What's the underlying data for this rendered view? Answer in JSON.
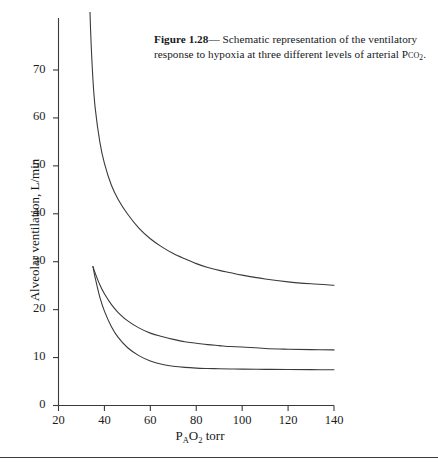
{
  "caption": {
    "figure_label": "Figure 1.28",
    "dash": "— ",
    "text_line1": "Schematic representation of the ventilatory",
    "text_line2": "response to hypoxia at three different levels of arterial",
    "gas_prefix": "P",
    "gas_smallcaps": "co",
    "gas_subscript": "2",
    "gas_period": ".",
    "full_text": "Figure 1.28— Schematic representation of the ventilatory response to hypoxia at three different levels of arterial Pco2."
  },
  "chart_data": {
    "type": "line",
    "title": "",
    "xlabel": "PAO2 torr",
    "ylabel": "Alveolar ventilation, L/min",
    "xlim": [
      20,
      140
    ],
    "ylim": [
      0,
      75
    ],
    "xticks": [
      20,
      40,
      60,
      80,
      100,
      120,
      140
    ],
    "yticks": [
      0,
      10,
      20,
      30,
      40,
      50,
      60,
      70
    ],
    "grid": false,
    "legend": "none",
    "line_color": "#3a3a3a",
    "line_width": 1.1,
    "series": [
      {
        "name": "high PCO2",
        "x": [
          33.5,
          34,
          35,
          36,
          38,
          40,
          43,
          46,
          50,
          55,
          60,
          65,
          70,
          75,
          80,
          85,
          90,
          95,
          100,
          110,
          120,
          130,
          140
        ],
        "y": [
          86,
          78,
          68,
          62,
          55,
          50.5,
          46,
          43,
          40,
          37,
          34.8,
          33.1,
          31.7,
          30.6,
          29.6,
          28.8,
          28.2,
          27.7,
          27.2,
          26.4,
          25.8,
          25.4,
          25.1
        ]
      },
      {
        "name": "normal PCO2",
        "x": [
          35,
          36,
          38,
          40,
          43,
          46,
          50,
          55,
          60,
          65,
          70,
          75,
          80,
          85,
          90,
          95,
          100,
          110,
          120,
          130,
          140
        ],
        "y": [
          29,
          27.6,
          25.2,
          23.3,
          21.1,
          19.4,
          17.7,
          16.2,
          15.1,
          14.4,
          13.8,
          13.3,
          13.0,
          12.7,
          12.5,
          12.3,
          12.2,
          11.9,
          11.75,
          11.65,
          11.6
        ]
      },
      {
        "name": "low PCO2",
        "x": [
          35,
          36,
          38,
          40,
          43,
          46,
          50,
          55,
          60,
          65,
          70,
          75,
          80,
          85,
          90,
          95,
          100,
          110,
          120,
          130,
          140
        ],
        "y": [
          29,
          26.6,
          22.6,
          19.7,
          16.5,
          14.2,
          12.1,
          10.4,
          9.3,
          8.6,
          8.2,
          7.95,
          7.8,
          7.72,
          7.66,
          7.62,
          7.58,
          7.54,
          7.5,
          7.48,
          7.45
        ]
      }
    ]
  },
  "axis": {
    "x_tick_labels": [
      "20",
      "40",
      "60",
      "80",
      "100",
      "120",
      "140"
    ],
    "y_tick_labels": [
      "0",
      "10",
      "20",
      "30",
      "40",
      "50",
      "60",
      "70"
    ],
    "x_title_main": "P",
    "x_title_sub1": "A",
    "x_title_mid": "O",
    "x_title_sub2": "2",
    "x_title_unit": " torr",
    "y_title": "Alveolar ventilation, L/min"
  },
  "colors": {
    "axis": "#3a3a3a",
    "curve": "#3a3a3a",
    "text": "#1a1a1a",
    "background": "#ffffff"
  }
}
